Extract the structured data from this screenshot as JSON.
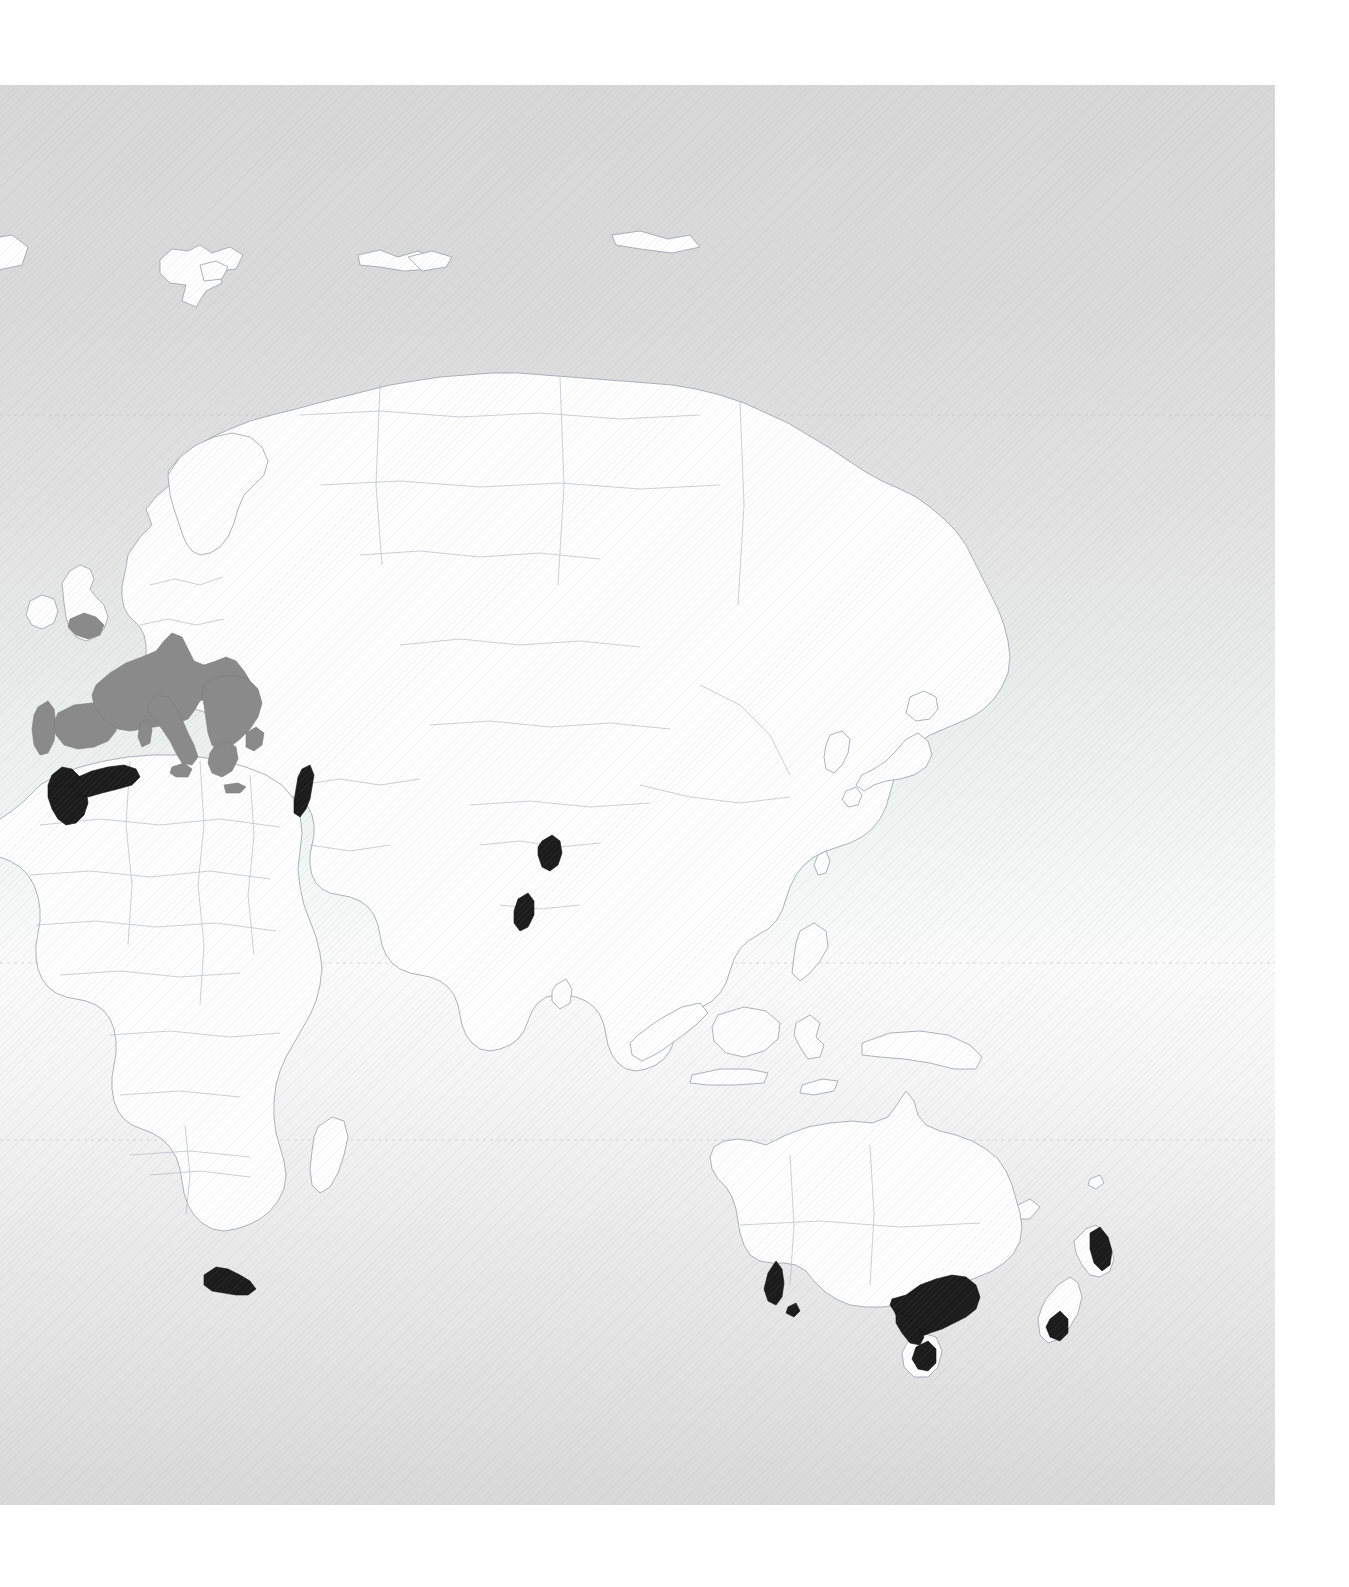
{
  "figure": {
    "panel": {
      "left": 0,
      "top": 85,
      "width": 1275,
      "height": 1420
    },
    "page": {
      "width": 1349,
      "height": 1587
    },
    "background": {
      "gradient_top_color": "#d8d8d8",
      "gradient_mid_color": "#fbfbfb",
      "gradient_bottom_color": "#d9d9d9",
      "texture": "diagonal-hatch",
      "page_color": "#ffffff"
    }
  },
  "legend_colors": {
    "land_fill": "#ffffff",
    "land_outline": "#9aa0a6",
    "country_border": "#b7bcc1",
    "category_gray": "#8a8a8a",
    "category_black": "#1b1b1b",
    "graticule": "#b9bec2"
  },
  "graticule": {
    "visible": true,
    "style": "dotted",
    "lines": [
      {
        "name": "upper-parallel",
        "y": 415
      },
      {
        "name": "equator",
        "y": 963
      },
      {
        "name": "tropic-of-capricorn",
        "y": 1140
      }
    ]
  },
  "chart_data": {
    "type": "map",
    "projection": "equirectangular",
    "hemisphere": "eastern",
    "categories": [
      {
        "key": "primary",
        "color": "#8a8a8a",
        "label": "Primary range"
      },
      {
        "key": "secondary",
        "color": "#1b1b1b",
        "label": "Secondary range"
      }
    ],
    "highlighted_regions": [
      {
        "name": "Southern and Central Europe",
        "category": "primary",
        "color": "#8a8a8a"
      },
      {
        "name": "Iberian Peninsula",
        "category": "primary",
        "color": "#8a8a8a"
      },
      {
        "name": "Italy",
        "category": "primary",
        "color": "#8a8a8a"
      },
      {
        "name": "Balkans and Greece",
        "category": "primary",
        "color": "#8a8a8a"
      },
      {
        "name": "Southern England",
        "category": "primary",
        "color": "#8a8a8a"
      },
      {
        "name": "Morocco (Atlas region)",
        "category": "secondary",
        "color": "#1b1b1b"
      },
      {
        "name": "Northern Algeria and Tunisia",
        "category": "secondary",
        "color": "#1b1b1b"
      },
      {
        "name": "Levant coast",
        "category": "secondary",
        "color": "#1b1b1b"
      },
      {
        "name": "Central northern India",
        "category": "secondary",
        "color": "#1b1b1b"
      },
      {
        "name": "Western India (Western Ghats)",
        "category": "secondary",
        "color": "#1b1b1b"
      },
      {
        "name": "Western Cape, South Africa",
        "category": "secondary",
        "color": "#1b1b1b"
      },
      {
        "name": "Southwestern Australia",
        "category": "secondary",
        "color": "#1b1b1b"
      },
      {
        "name": "Southeastern Australia (Victoria and New South Wales)",
        "category": "secondary",
        "color": "#1b1b1b"
      },
      {
        "name": "Tasmania",
        "category": "secondary",
        "color": "#1b1b1b"
      },
      {
        "name": "New Zealand North Island (east coast)",
        "category": "secondary",
        "color": "#1b1b1b"
      },
      {
        "name": "New Zealand South Island (Central Otago)",
        "category": "secondary",
        "color": "#1b1b1b"
      }
    ],
    "unhighlighted_landmasses": [
      "Russia and Siberia",
      "Scandinavia",
      "Northern Europe",
      "British Isles",
      "Svalbard",
      "Novaya Zemlya",
      "Iceland (partial)",
      "Turkey",
      "Arabian Peninsula",
      "Iran",
      "Central Asia",
      "China",
      "Mongolia",
      "Korean Peninsula",
      "Japan",
      "Southeast Asia",
      "Indonesia",
      "Philippines",
      "Papua New Guinea",
      "Northern and Central Africa",
      "Madagascar",
      "Sri Lanka",
      "Australia (interior)",
      "New Caledonia",
      "Fiji"
    ],
    "legend_position": "none",
    "grid": true
  }
}
